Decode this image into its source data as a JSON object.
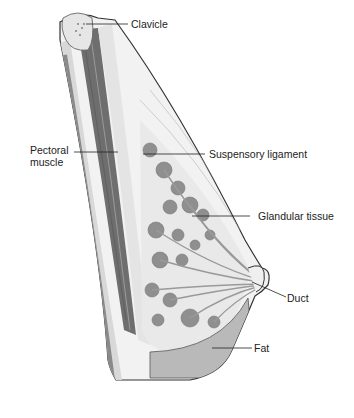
{
  "diagram": {
    "labels": [
      {
        "id": "clavicle",
        "text": "Clavicle"
      },
      {
        "id": "pectoral",
        "text": "Pectoral\nmuscle",
        "line1": "Pectoral",
        "line2": "muscle"
      },
      {
        "id": "suspensory",
        "text": "Suspensory ligament"
      },
      {
        "id": "glandular",
        "text": "Glandular tissue"
      },
      {
        "id": "duct",
        "text": "Duct"
      },
      {
        "id": "fat",
        "text": "Fat"
      }
    ],
    "colors": {
      "outline": "#333333",
      "muscle": "#6e6e6e",
      "muscle_light": "#9a9a9a",
      "tissue_bg": "#ececec",
      "lobule": "#8f8f8f",
      "fat": "#b9b9b9",
      "bone": "#e6e6e6"
    }
  }
}
